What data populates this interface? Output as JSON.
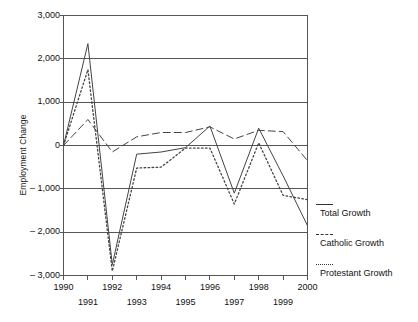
{
  "chart_data": {
    "type": "line",
    "title": "",
    "xlabel": "",
    "ylabel": "Employment Change",
    "x": [
      1990,
      1991,
      1992,
      1993,
      1994,
      1995,
      1996,
      1997,
      1998,
      1999,
      2000
    ],
    "xtick_labels": [
      "1990",
      "1991",
      "1992",
      "1993",
      "1994",
      "1995",
      "1996",
      "1997",
      "1998",
      "1999",
      "2000"
    ],
    "ytick_labels": [
      "3,000",
      "2,000",
      "1,000",
      "0",
      "– 1,000",
      "– 2,000",
      "– 3,000"
    ],
    "ytick_values": [
      3000,
      2000,
      1000,
      0,
      -1000,
      -2000,
      -3000
    ],
    "ylim": [
      -3000,
      3000
    ],
    "xlim": [
      1990,
      2000
    ],
    "grid": "horizontal",
    "legend_position": "right",
    "series": [
      {
        "name": "Total Growth",
        "style": "solid",
        "color": "#444444",
        "values": [
          0,
          2350,
          -2750,
          -200,
          -150,
          -50,
          450,
          -1100,
          400,
          -700,
          -1850
        ]
      },
      {
        "name": "Catholic Growth",
        "style": "dashed",
        "color": "#444444",
        "values": [
          0,
          600,
          -150,
          200,
          300,
          300,
          430,
          150,
          350,
          320,
          -350
        ]
      },
      {
        "name": "Protestant Growth",
        "style": "dotted",
        "color": "#444444",
        "values": [
          0,
          1750,
          -2900,
          -520,
          -500,
          -60,
          -60,
          -1350,
          60,
          -1150,
          -1250
        ]
      }
    ]
  },
  "legend": {
    "entries": [
      {
        "label": "Total Growth",
        "style": "solid"
      },
      {
        "label": "Catholic Growth",
        "style": "dashed"
      },
      {
        "label": "Protestant Growth",
        "style": "dotted"
      }
    ]
  },
  "axes": {
    "y_title": "Employment Change"
  }
}
